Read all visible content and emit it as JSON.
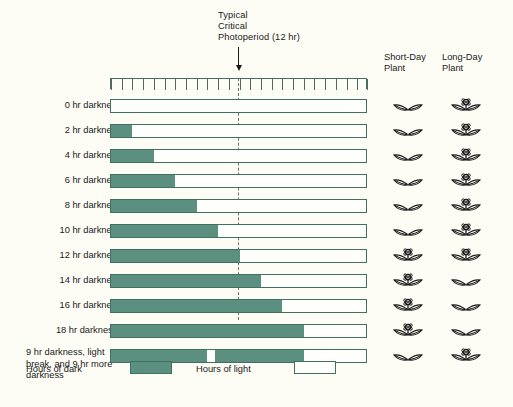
{
  "annotation": {
    "line1": "Typical",
    "line2": "Critical",
    "line3": "Photoperiod (12 hr)",
    "arrow_icon": "down-arrow-icon"
  },
  "axis": {
    "hours_total": 24,
    "tick_count": 25,
    "critical_photoperiod_hr": 12
  },
  "columns": {
    "short_day": {
      "line1": "Short-Day",
      "line2": "Plant"
    },
    "long_day": {
      "line1": "Long-Day",
      "line2": "Plant"
    }
  },
  "legend": {
    "dark_label": "Hours of dark",
    "light_label": "Hours of light"
  },
  "colors": {
    "dark": "#5b8f80",
    "light": "#fffffb",
    "bar_border": "#3f7063",
    "background": "#fdfdf6",
    "text": "#1a1a1a",
    "critical_line": "#6e6e6e"
  },
  "chart_data": {
    "type": "bar",
    "xlabel": "Hours (0-24)",
    "ylabel": "",
    "xlim": [
      0,
      24
    ],
    "grid": false,
    "legend_position": "bottom",
    "annotations": [
      "Typical Critical Photoperiod (12 hr)",
      "* 18 hr darkness"
    ],
    "categories": [
      "0 hr darkness",
      "2 hr darkness",
      "4 hr darkness",
      "6 hr darkness",
      "8 hr darkness",
      "10 hr darkness",
      "12 hr darkness",
      "14 hr darkness",
      "16 hr darkness",
      "18 hr darkness*",
      "9 hr darkness, light break, and 9 hr more darkness"
    ],
    "series": [
      {
        "name": "Hours of dark",
        "values": [
          0,
          2,
          4,
          6,
          8,
          10,
          12,
          14,
          16,
          18,
          18
        ]
      },
      {
        "name": "Hours of light",
        "values": [
          24,
          22,
          20,
          18,
          16,
          14,
          12,
          10,
          8,
          6,
          6
        ]
      }
    ],
    "rows": [
      {
        "label": "0 hr darkness",
        "dark_hours": 0,
        "light_hours": 24,
        "dark_segments": [],
        "short_day_flowers": false,
        "long_day_flowers": true
      },
      {
        "label": "2 hr darkness",
        "dark_hours": 2,
        "light_hours": 22,
        "dark_segments": [
          [
            0,
            2
          ]
        ],
        "short_day_flowers": false,
        "long_day_flowers": true
      },
      {
        "label": "4 hr darkness",
        "dark_hours": 4,
        "light_hours": 20,
        "dark_segments": [
          [
            0,
            4
          ]
        ],
        "short_day_flowers": false,
        "long_day_flowers": true
      },
      {
        "label": "6 hr darkness",
        "dark_hours": 6,
        "light_hours": 18,
        "dark_segments": [
          [
            0,
            6
          ]
        ],
        "short_day_flowers": false,
        "long_day_flowers": true
      },
      {
        "label": "8 hr darkness",
        "dark_hours": 8,
        "light_hours": 16,
        "dark_segments": [
          [
            0,
            8
          ]
        ],
        "short_day_flowers": false,
        "long_day_flowers": true
      },
      {
        "label": "10 hr darkness",
        "dark_hours": 10,
        "light_hours": 14,
        "dark_segments": [
          [
            0,
            10
          ]
        ],
        "short_day_flowers": false,
        "long_day_flowers": true
      },
      {
        "label": "12 hr darkness",
        "dark_hours": 12,
        "light_hours": 12,
        "dark_segments": [
          [
            0,
            12
          ]
        ],
        "short_day_flowers": true,
        "long_day_flowers": true
      },
      {
        "label": "14 hr darkness",
        "dark_hours": 14,
        "light_hours": 10,
        "dark_segments": [
          [
            0,
            14
          ]
        ],
        "short_day_flowers": true,
        "long_day_flowers": false
      },
      {
        "label": "16 hr darkness",
        "dark_hours": 16,
        "light_hours": 8,
        "dark_segments": [
          [
            0,
            16
          ]
        ],
        "short_day_flowers": true,
        "long_day_flowers": false
      },
      {
        "label": "18 hr darkness*",
        "dark_hours": 18,
        "light_hours": 6,
        "dark_segments": [
          [
            0,
            18
          ]
        ],
        "short_day_flowers": true,
        "long_day_flowers": false
      },
      {
        "label": "9 hr darkness, light break, and 9 hr more darkness",
        "dark_hours": 18,
        "light_hours": 6,
        "dark_segments": [
          [
            0,
            9
          ],
          [
            9.7,
            18
          ]
        ],
        "light_break": [
          9,
          9.7
        ],
        "short_day_flowers": false,
        "long_day_flowers": true,
        "multiline": true
      }
    ]
  }
}
